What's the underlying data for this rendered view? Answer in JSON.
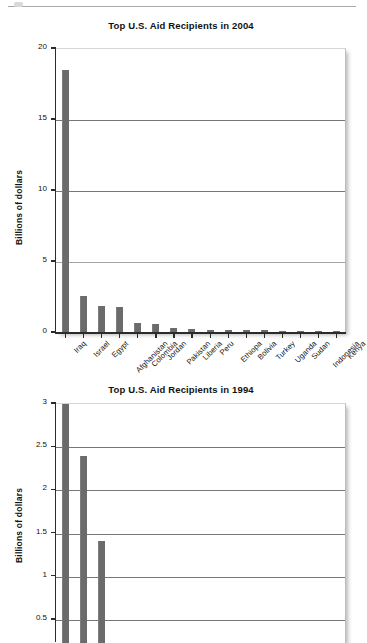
{
  "page": {
    "background_color": "#ffffff",
    "bar_color": "#6b6b6b",
    "axis_color": "#2b2b2b"
  },
  "charts": [
    {
      "id": "chart-2004",
      "title": "Top U.S. Aid Recipients in 2004",
      "ylabel": "Billions of dollars",
      "ytick_labels": [
        "20",
        "15",
        "10",
        "5",
        "0"
      ],
      "ytick_values": [
        20,
        15,
        10,
        5,
        0
      ],
      "ylim": [
        0,
        20
      ],
      "categories": [
        "Iraq",
        "Israel",
        "Egypt",
        "Afghanistan",
        "Colombia",
        "Jordan",
        "Pakistan",
        "Liberia",
        "Peru",
        "Ethiopa",
        "Bolivia",
        "Turkey",
        "Uganda",
        "Sudan",
        "Indonesia",
        "Kenya"
      ],
      "values": [
        18.5,
        2.6,
        1.9,
        1.85,
        0.72,
        0.6,
        0.37,
        0.26,
        0.23,
        0.22,
        0.2,
        0.18,
        0.17,
        0.16,
        0.15,
        0.14
      ]
    },
    {
      "id": "chart-1994",
      "title": "Top U.S. Aid Recipients in 1994",
      "ylabel": "Billions of dollars",
      "ytick_labels": [
        "3",
        "2.5",
        "2",
        "1.5",
        "1",
        "0.5"
      ],
      "ytick_values": [
        3,
        2.5,
        2,
        1.5,
        1,
        0.5
      ],
      "ylim": [
        0.28,
        3.05
      ],
      "categories": [
        "",
        "",
        ""
      ],
      "values": [
        3.05,
        2.4,
        1.41
      ]
    }
  ],
  "chart_data": [
    {
      "type": "bar",
      "title": "Top U.S. Aid Recipients in 2004",
      "xlabel": "",
      "ylabel": "Billions of dollars",
      "ylim": [
        0,
        20
      ],
      "yticks": [
        0,
        5,
        10,
        15,
        20
      ],
      "grid": "horizontal",
      "legend": "none",
      "categories": [
        "Iraq",
        "Israel",
        "Egypt",
        "Afghanistan",
        "Colombia",
        "Jordan",
        "Pakistan",
        "Liberia",
        "Peru",
        "Ethiopa",
        "Bolivia",
        "Turkey",
        "Uganda",
        "Sudan",
        "Indonesia",
        "Kenya"
      ],
      "values": [
        18.5,
        2.6,
        1.9,
        1.85,
        0.72,
        0.6,
        0.37,
        0.26,
        0.23,
        0.22,
        0.2,
        0.18,
        0.17,
        0.16,
        0.15,
        0.14
      ]
    },
    {
      "type": "bar",
      "title": "Top U.S. Aid Recipients in 1994",
      "xlabel": "",
      "ylabel": "Billions of dollars",
      "ylim": [
        0.28,
        3.05
      ],
      "yticks": [
        0.5,
        1,
        1.5,
        2,
        2.5,
        3
      ],
      "grid": "horizontal",
      "legend": "none",
      "note": "chart is cropped at the bottom of the image; x-axis category labels are not visible",
      "categories": [
        "bar-1",
        "bar-2",
        "bar-3"
      ],
      "values": [
        3.05,
        2.4,
        1.41
      ]
    }
  ]
}
